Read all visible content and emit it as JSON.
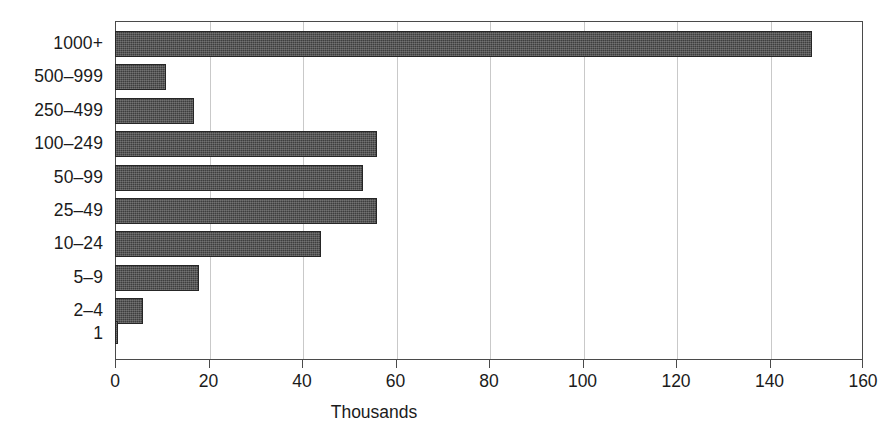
{
  "chart_data": {
    "type": "bar",
    "orientation": "horizontal",
    "title": "",
    "subtitle": "",
    "xlabel": "Thousands",
    "ylabel": "",
    "categories": [
      "1000+",
      "500–999",
      "250–499",
      "100–249",
      "50–99",
      "25–49",
      "10–24",
      "5–9",
      "2–4",
      "1"
    ],
    "values": [
      149,
      11,
      17,
      56,
      53,
      56,
      44,
      18,
      6,
      0.5
    ],
    "series": [
      {
        "name": "Thousands",
        "values": [
          149,
          11,
          17,
          56,
          53,
          56,
          44,
          18,
          6,
          0.5
        ]
      }
    ],
    "xlim": [
      0,
      160
    ],
    "xticks": [
      0,
      20,
      40,
      60,
      80,
      100,
      120,
      140,
      160
    ],
    "xtick_labels": [
      "0",
      "20",
      "40",
      "60",
      "80",
      "100",
      "120",
      "140",
      "160"
    ],
    "grid": true,
    "grid_axis": "x",
    "legend": false,
    "legend_position": "none",
    "bar_fill_color": "#3e3e3e",
    "bar_edge_color": "#262626",
    "grid_color": "#c9c9c9",
    "axis_color": "#4a4a4a",
    "background_color": "#ffffff",
    "text_color": "#1b1b1b"
  }
}
